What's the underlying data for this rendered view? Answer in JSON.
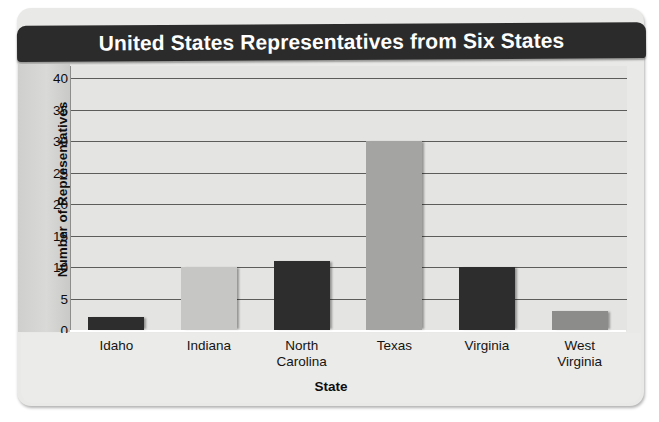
{
  "chart_data": {
    "type": "bar",
    "title": "United States Representatives from Six States",
    "xlabel": "State",
    "ylabel": "Number of Representatives",
    "categories": [
      "Idaho",
      "Indiana",
      "North Carolina",
      "Texas",
      "Virginia",
      "West Virginia"
    ],
    "category_lines": [
      [
        "Idaho"
      ],
      [
        "Indiana"
      ],
      [
        "North",
        "Carolina"
      ],
      [
        "Texas"
      ],
      [
        "Virginia"
      ],
      [
        "West",
        "Virginia"
      ]
    ],
    "values": [
      2,
      10,
      11,
      30,
      10,
      3
    ],
    "bar_colors": [
      "#2d2d2d",
      "#c6c6c4",
      "#2d2d2d",
      "#a4a4a2",
      "#2d2d2d",
      "#8c8c8a"
    ],
    "ylim": [
      0,
      40
    ],
    "ytick_values": [
      40,
      35,
      30,
      25,
      20,
      15,
      10,
      5,
      0
    ],
    "ytick_labels": [
      "40",
      "35",
      "30",
      "25",
      "20",
      "15",
      "10",
      "5",
      "0"
    ],
    "grid": true,
    "grid_axis": "y",
    "legend": null,
    "annotations": []
  },
  "style": {
    "title_bg": "#2b2b2b",
    "title_fg": "#ffffff",
    "plot_bg": "#e4e4e2",
    "card_bg": "#e9e9e7",
    "grid_color": "#5c5c5a",
    "axis_band_color": "#d4d4d2"
  }
}
